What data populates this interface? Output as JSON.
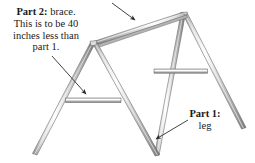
{
  "figure": {
    "background_color": "#ffffff",
    "width": 255,
    "height": 163
  },
  "callouts": {
    "part2": {
      "label_bold": "Part 2",
      "label_sep": ":",
      "line1_rest": " brace.",
      "line2": "This is to be 40",
      "line3": "inches less than",
      "line4": "part 1."
    },
    "part1": {
      "label_bold": "Part 1",
      "label_sep": ":",
      "line2": "leg"
    }
  },
  "arrows": {
    "top_arrow_name": "arrow-to-ridge-beam",
    "part2_arrow_name": "arrow-to-brace",
    "part1_arrow_name": "arrow-to-leg"
  },
  "colors": {
    "line": "#3a3a3a",
    "tube_light": "#fdfdfd",
    "tube_mid": "#c9c9c9",
    "tube_dark": "#8e8e8e",
    "tube_shadow": "#6b6b6b",
    "text": "#1a1a1a"
  },
  "parts": [
    {
      "name": "ridge-beam",
      "role": "top horizontal member joining the two A-frames"
    },
    {
      "name": "left-frame-left-leg",
      "role": "leg"
    },
    {
      "name": "left-frame-right-leg",
      "role": "leg"
    },
    {
      "name": "right-frame-left-leg",
      "role": "leg"
    },
    {
      "name": "right-frame-right-leg",
      "role": "leg"
    },
    {
      "name": "left-brace",
      "role": "horizontal brace, part 2"
    },
    {
      "name": "right-brace",
      "role": "horizontal brace, part 2"
    }
  ]
}
